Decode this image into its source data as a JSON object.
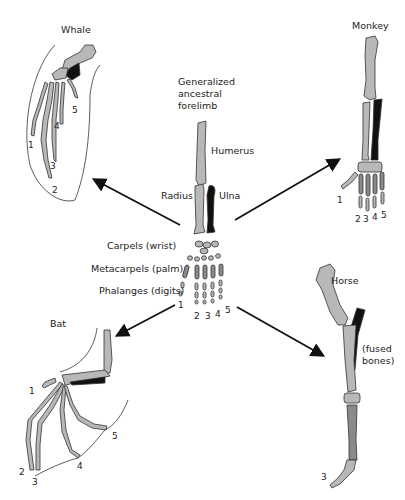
{
  "diagram": {
    "center": {
      "title_lines": [
        "Generalized",
        "ancestral",
        "forelimb"
      ],
      "bones": {
        "humerus": "Humerus",
        "radius": "Radius",
        "ulna": "Ulna",
        "carpels": "Carpels (wrist)",
        "metacarpels": "Metacarpels (palm)",
        "phalanges": "Phalanges (digits)"
      },
      "digits": [
        "1",
        "2",
        "3",
        "4",
        "5"
      ]
    },
    "animals": [
      {
        "name": "Whale",
        "position": "top-left",
        "digits": [
          "1",
          "2",
          "3",
          "4",
          "5"
        ]
      },
      {
        "name": "Monkey",
        "position": "top-right",
        "digits": [
          "1",
          "2",
          "3",
          "4",
          "5"
        ]
      },
      {
        "name": "Bat",
        "position": "bottom-left",
        "digits": [
          "1",
          "2",
          "3",
          "4",
          "5"
        ]
      },
      {
        "name": "Horse",
        "position": "bottom-right",
        "digits": [
          "3"
        ],
        "note": "(fused bones)",
        "note_lines": [
          "(fused",
          "bones)"
        ]
      }
    ],
    "colors": {
      "humerus_radius": "#b8b8b8",
      "ulna": "#111111",
      "hand_bones": "#9a9a9a",
      "outline": "#333333",
      "arrows": "#111111"
    }
  }
}
